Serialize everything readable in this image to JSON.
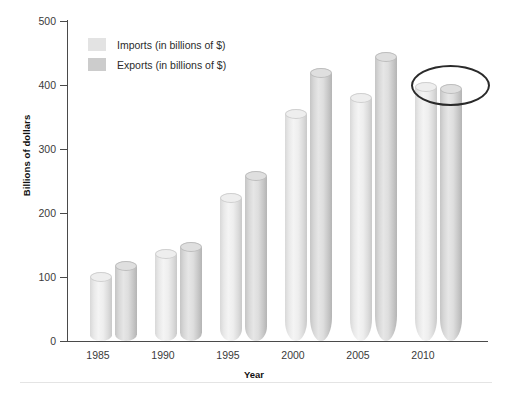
{
  "chart_data": {
    "type": "bar",
    "title": "",
    "xlabel": "Year",
    "ylabel": "Billions of dollars",
    "categories": [
      "1985",
      "1990",
      "1995",
      "2000",
      "2005",
      "2010"
    ],
    "series": [
      {
        "name": "Imports (in billions of $)",
        "color": "#e3e3e3",
        "values": [
          108,
          144,
          231,
          362,
          388,
          404
        ]
      },
      {
        "name": "Exports (in billions of $)",
        "color": "#cccccc",
        "values": [
          125,
          154,
          266,
          426,
          451,
          401
        ]
      }
    ],
    "ylim": [
      0,
      500
    ],
    "yticks": [
      0,
      100,
      200,
      300,
      400,
      500
    ],
    "ytick_labels": [
      "0",
      "100",
      "200",
      "300",
      "400",
      "500"
    ],
    "grid": false,
    "legend_position": "upper left",
    "annotations": [
      {
        "name": "ellipse-highlight",
        "shape": "ellipse",
        "targets": [
          "2010 Imports",
          "2010 Exports"
        ],
        "color": "#2a2a2a"
      }
    ]
  },
  "legend": {
    "items": [
      {
        "label": "Imports (in billions of $)",
        "swatch": "imports"
      },
      {
        "label": "Exports (in billions of $)",
        "swatch": "exports"
      }
    ]
  }
}
